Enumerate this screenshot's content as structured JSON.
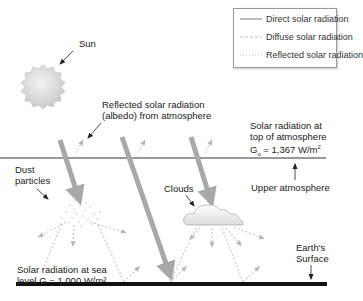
{
  "legend": {
    "items": [
      {
        "label": "Direct solar radiation",
        "style": "solid"
      },
      {
        "label": "Diffuse solar radiation",
        "style": "dashed"
      },
      {
        "label": "Reflected solar radiation",
        "style": "dotted"
      }
    ]
  },
  "labels": {
    "sun": "Sun",
    "reflected_line1": "Reflected solar radiation",
    "reflected_line2": "(albedo) from atmosphere",
    "toa_line1": "Solar radiation at",
    "toa_line2": "top of atmosphere",
    "toa_line3_prefix": "G",
    "toa_line3_sub": "o",
    "toa_line3_value": " = 1,367 W/m",
    "toa_line3_sup": "2",
    "upper_atmosphere": "Upper atmosphere",
    "dust_line1": "Dust",
    "dust_line2": "particles",
    "clouds": "Clouds",
    "earth_line1": "Earth's",
    "earth_line2": "Surface",
    "sea_line1": "Solar radiation at sea",
    "sea_line2": "level G = 1,000 W/m²"
  },
  "colors": {
    "direct": "#a8a8a8",
    "diffuse": "#c8c8c8",
    "reflected": "#d4d4d4",
    "atmosphere_line": "#333333",
    "surface": "#111111"
  }
}
